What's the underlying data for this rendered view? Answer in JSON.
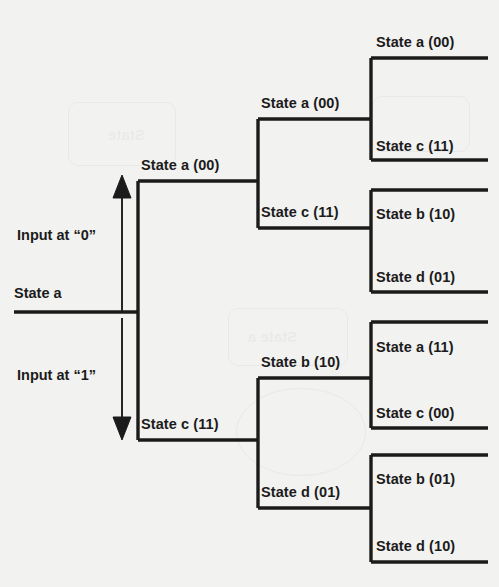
{
  "diagram": {
    "type": "binary-state-transition-tree",
    "background_color": "#f2f2f0",
    "line_color": "#1b1b1b",
    "text_color": "#1b1b1b",
    "root": {
      "label": "State  a"
    },
    "branch_annotations": [
      {
        "id": "input-0",
        "text": "Input at “0”",
        "direction": "up"
      },
      {
        "id": "input-1",
        "text": "Input at “1”",
        "direction": "down"
      }
    ],
    "level1": [
      {
        "id": "l1-top",
        "name": "State a",
        "code": "(00)"
      },
      {
        "id": "l1-bottom",
        "name": "State c",
        "code": "(11)"
      }
    ],
    "level2": [
      {
        "id": "l2-1",
        "name": "State a",
        "code": "(00)"
      },
      {
        "id": "l2-2",
        "name": "State c",
        "code": "(11)"
      },
      {
        "id": "l2-3",
        "name": "State b",
        "code": "(10)"
      },
      {
        "id": "l2-4",
        "name": "State d",
        "code": "(01)"
      }
    ],
    "level3": [
      {
        "id": "l3-1",
        "name": "State a",
        "code": "(00)"
      },
      {
        "id": "l3-2",
        "name": "State c",
        "code": "(11)"
      },
      {
        "id": "l3-3",
        "name": "State b",
        "code": "(10)"
      },
      {
        "id": "l3-4",
        "name": "State d",
        "code": "(01)"
      },
      {
        "id": "l3-5",
        "name": "State a",
        "code": "(11)"
      },
      {
        "id": "l3-6",
        "name": "State c",
        "code": "(00)"
      },
      {
        "id": "l3-7",
        "name": "State b",
        "code": "(01)"
      },
      {
        "id": "l3-8",
        "name": "State d",
        "code": "(10)"
      }
    ],
    "ghost_artifacts": [
      {
        "id": "ghost-state-top",
        "text": "State"
      },
      {
        "id": "ghost-state-mid",
        "text": "State a"
      }
    ]
  }
}
